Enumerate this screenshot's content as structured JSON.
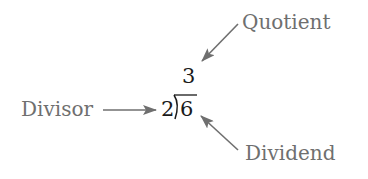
{
  "diagram": {
    "expression": {
      "divisor": "2",
      "dividend": "6",
      "quotient": "3"
    },
    "labels": {
      "quotient": "Quotient",
      "divisor": "Divisor",
      "dividend": "Dividend"
    },
    "colors": {
      "label_text": "#6f6f6f",
      "arrow": "#6f6f6f",
      "math_text": "#1a1a1a",
      "background": "#ffffff"
    }
  }
}
